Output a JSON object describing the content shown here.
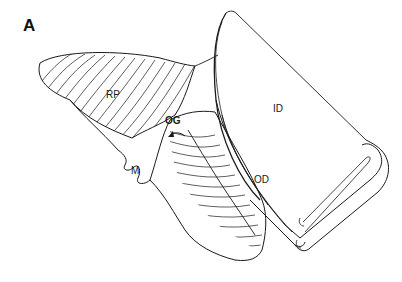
{
  "figure": {
    "panel_label": "A",
    "labels": {
      "rp": "RP",
      "id": "ID",
      "og": "OG",
      "od": "OD",
      "m": "M"
    },
    "colors": {
      "line": "#1a1a1a",
      "background": "#ffffff"
    }
  }
}
